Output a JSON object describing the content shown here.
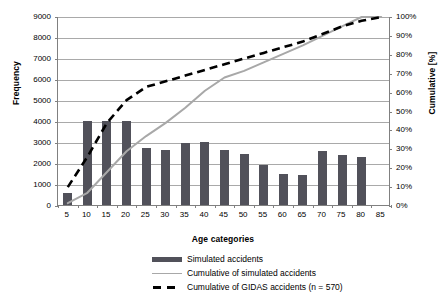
{
  "chart_data": {
    "type": "bar",
    "title": "",
    "xlabel": "Age categories",
    "ylabel": "Frequency",
    "y2label": "Cumulative [%]",
    "grid": true,
    "legend_position": "bottom",
    "ylim": [
      0,
      9000
    ],
    "y2lim": [
      0,
      100
    ],
    "categories": [
      "5",
      "10",
      "15",
      "20",
      "25",
      "30",
      "35",
      "40",
      "45",
      "50",
      "55",
      "60",
      "65",
      "70",
      "75",
      "80",
      "85"
    ],
    "y_ticks": [
      "0",
      "1000",
      "2000",
      "3000",
      "4000",
      "5000",
      "6000",
      "7000",
      "8000",
      "9000"
    ],
    "y2_ticks": [
      "0%",
      "10%",
      "20%",
      "30%",
      "40%",
      "50%",
      "60%",
      "70%",
      "80%",
      "90%",
      "100%"
    ],
    "series": [
      {
        "name": "Simulated accidents",
        "type": "bar",
        "axis": "left",
        "color": "#51515a",
        "values": [
          550,
          4000,
          4000,
          4000,
          2700,
          2600,
          2950,
          2980,
          2600,
          2450,
          1900,
          1500,
          1450,
          2550,
          2400,
          2300,
          0
        ]
      },
      {
        "name": "Cumulative of simulated accidents",
        "type": "line",
        "axis": "right",
        "color": "#a8a8a8",
        "values": [
          1.5,
          7.0,
          18.0,
          29.0,
          37.0,
          44.0,
          52.0,
          61.0,
          68.0,
          71.5,
          76.0,
          80.5,
          85.0,
          90.0,
          95.0,
          100.0,
          100.0
        ]
      },
      {
        "name": "Cumulative of GIDAS accidents  (n = 570)",
        "type": "line",
        "style": "dashed",
        "axis": "right",
        "color": "#000000",
        "values": [
          10.0,
          26.0,
          44.0,
          56.0,
          63.0,
          66.0,
          69.0,
          72.0,
          75.0,
          78.0,
          81.0,
          84.0,
          87.0,
          91.0,
          95.0,
          98.0,
          100.0
        ]
      }
    ],
    "legend": [
      {
        "label": "Simulated accidents",
        "key": "bar-swatch",
        "color": "#51515a"
      },
      {
        "label": "Cumulative of simulated accidents",
        "key": "line-swatch",
        "color": "#a8a8a8"
      },
      {
        "label": "Cumulative of GIDAS accidents  (n = 570)",
        "key": "dashed-line-swatch",
        "color": "#000000"
      }
    ]
  }
}
